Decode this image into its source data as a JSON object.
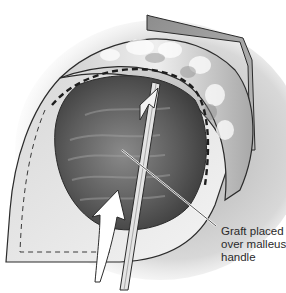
{
  "figure": {
    "type": "surgical illustration",
    "annotation": {
      "lines": [
        "Graft placed",
        "over malleus",
        "handle"
      ]
    },
    "colors": {
      "background": "#ffffff",
      "line": "#2b2b2b",
      "shade_dark": "#5a5a5a",
      "shade_mid": "#9a9a9a",
      "shade_light": "#e6e6e6"
    }
  }
}
